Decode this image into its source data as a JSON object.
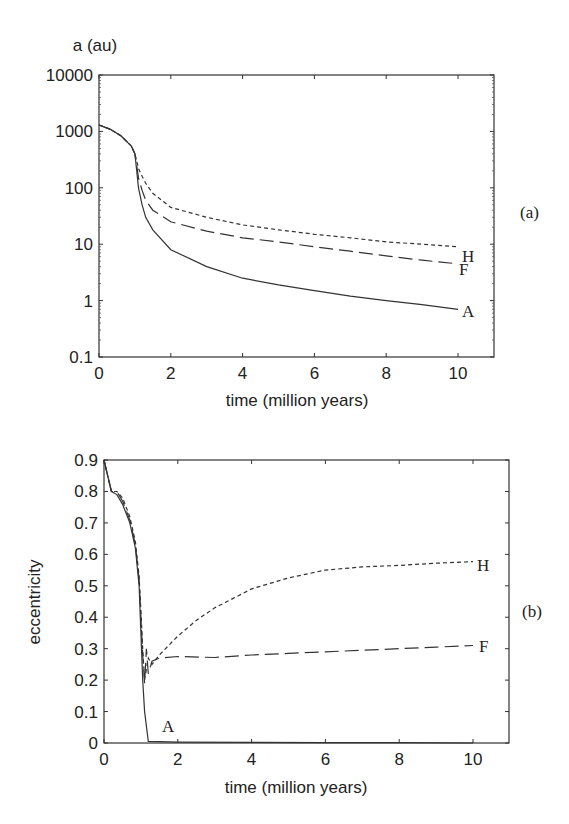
{
  "chart_data": [
    {
      "type": "line",
      "panel": "(a)",
      "title": "",
      "xlabel": "time (million years)",
      "ylabel": "a (au)",
      "yscale": "log",
      "xlim": [
        0,
        11
      ],
      "ylim": [
        0.1,
        10000
      ],
      "xticks": [
        "0",
        "2",
        "4",
        "6",
        "8",
        "10"
      ],
      "yticks": [
        "0.1",
        "1",
        "10",
        "100",
        "1000",
        "10000"
      ],
      "grid": false,
      "series": [
        {
          "name": "A",
          "style": "solid",
          "x": [
            0,
            0.3,
            0.6,
            0.9,
            1.0,
            1.05,
            1.1,
            1.2,
            1.3,
            1.5,
            2,
            3,
            4,
            5,
            6,
            7,
            8,
            9,
            10
          ],
          "values": [
            1300,
            1100,
            850,
            550,
            400,
            200,
            100,
            50,
            30,
            18,
            8,
            4,
            2.5,
            1.9,
            1.5,
            1.2,
            1.0,
            0.85,
            0.7
          ]
        },
        {
          "name": "F",
          "style": "long-dash",
          "x": [
            0,
            0.3,
            0.6,
            0.9,
            1.0,
            1.05,
            1.1,
            1.2,
            1.3,
            1.5,
            2,
            3,
            4,
            5,
            6,
            7,
            8,
            9,
            10
          ],
          "values": [
            1300,
            1100,
            850,
            550,
            400,
            250,
            150,
            90,
            60,
            40,
            25,
            17,
            13,
            11,
            9,
            7.5,
            6.2,
            5.2,
            4.5
          ]
        },
        {
          "name": "H",
          "style": "short-dash",
          "x": [
            0,
            0.3,
            0.6,
            0.9,
            1.0,
            1.05,
            1.1,
            1.2,
            1.3,
            1.5,
            2,
            3,
            4,
            5,
            6,
            7,
            8,
            9,
            10
          ],
          "values": [
            1300,
            1100,
            850,
            550,
            400,
            300,
            220,
            160,
            120,
            80,
            45,
            30,
            22,
            18,
            15,
            13,
            11,
            10,
            9
          ]
        }
      ]
    },
    {
      "type": "line",
      "panel": "(b)",
      "title": "",
      "xlabel": "time (million years)",
      "ylabel": "eccentricity",
      "yscale": "linear",
      "xlim": [
        0,
        11
      ],
      "ylim": [
        0,
        0.9
      ],
      "xticks": [
        "0",
        "2",
        "4",
        "6",
        "8",
        "10"
      ],
      "yticks": [
        "0",
        "0.1",
        "0.2",
        "0.3",
        "0.4",
        "0.5",
        "0.6",
        "0.7",
        "0.8",
        "0.9"
      ],
      "grid": false,
      "series": [
        {
          "name": "A",
          "style": "solid",
          "x": [
            0,
            0.2,
            0.35,
            0.5,
            0.7,
            0.85,
            0.95,
            1.0,
            1.05,
            1.1,
            1.2,
            1.5,
            2,
            4,
            6,
            8,
            10
          ],
          "values": [
            0.9,
            0.8,
            0.79,
            0.76,
            0.7,
            0.62,
            0.5,
            0.35,
            0.2,
            0.1,
            0.005,
            0.004,
            0.003,
            0.002,
            0.001,
            0.001,
            0.0
          ]
        },
        {
          "name": "F",
          "style": "long-dash",
          "x": [
            0,
            0.2,
            0.35,
            0.5,
            0.7,
            0.85,
            0.95,
            1.0,
            1.05,
            1.1,
            1.15,
            1.2,
            1.3,
            1.5,
            2,
            3,
            4,
            5,
            6,
            7,
            8,
            9,
            10
          ],
          "values": [
            0.9,
            0.8,
            0.8,
            0.77,
            0.71,
            0.63,
            0.52,
            0.4,
            0.28,
            0.19,
            0.3,
            0.22,
            0.26,
            0.27,
            0.275,
            0.272,
            0.28,
            0.285,
            0.29,
            0.295,
            0.3,
            0.305,
            0.31
          ]
        },
        {
          "name": "H",
          "style": "short-dash",
          "x": [
            0,
            0.2,
            0.35,
            0.5,
            0.7,
            0.85,
            0.95,
            1.0,
            1.05,
            1.1,
            1.2,
            1.3,
            1.5,
            2,
            2.5,
            3,
            3.5,
            4,
            5,
            6,
            7,
            8,
            9,
            10
          ],
          "values": [
            0.9,
            0.8,
            0.8,
            0.78,
            0.72,
            0.64,
            0.53,
            0.42,
            0.3,
            0.2,
            0.27,
            0.25,
            0.28,
            0.34,
            0.39,
            0.43,
            0.46,
            0.49,
            0.525,
            0.55,
            0.56,
            0.565,
            0.572,
            0.577
          ]
        }
      ]
    }
  ],
  "labels": {
    "panel_a": "(a)",
    "panel_b": "(b)",
    "top_ylabel": "a (au)",
    "top_xlabel": "time (million years)",
    "bottom_ylabel": "eccentricity",
    "bottom_xlabel": "time (million years)",
    "series_A": "A",
    "series_F": "F",
    "series_H": "H"
  }
}
